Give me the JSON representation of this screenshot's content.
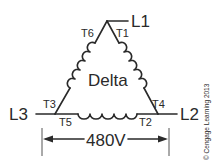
{
  "diagram": {
    "center_label": "Delta",
    "lines": {
      "l1": "L1",
      "l2": "L2",
      "l3": "L3"
    },
    "terminals": {
      "t1": "T1",
      "t2": "T2",
      "t3": "T3",
      "t4": "T4",
      "t5": "T5",
      "t6": "T6"
    },
    "voltage": "480V",
    "copyright": "© Cengage Learning 2013"
  },
  "colors": {
    "ink": "#2a2a2a",
    "background": "#ffffff"
  }
}
